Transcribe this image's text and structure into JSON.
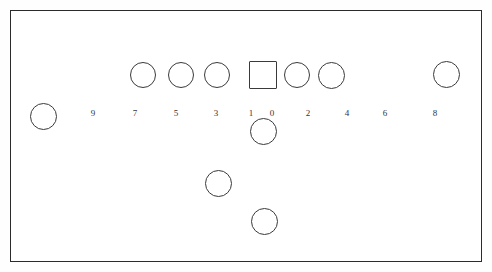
{
  "diagram": {
    "title": "",
    "canvas": {
      "width": 492,
      "height": 272,
      "background": "#fefefe"
    },
    "frame": {
      "x": 10,
      "y": 10,
      "width": 472,
      "height": 252,
      "stroke": "#2b2b2b",
      "stroke_width": 1.5
    },
    "stroke_color": "#3a3a3a",
    "label_color": "#34343a",
    "labels": [
      {
        "text": "9",
        "x": 93,
        "y": 108
      },
      {
        "text": "7",
        "x": 135,
        "y": 108
      },
      {
        "text": "5",
        "x": 176,
        "y": 108
      },
      {
        "text": "3",
        "x": 216,
        "y": 108
      },
      {
        "text": "1",
        "x": 251,
        "y": 108
      },
      {
        "text": "0",
        "x": 272,
        "y": 108
      },
      {
        "text": "2",
        "x": 308,
        "y": 108
      },
      {
        "text": "4",
        "x": 347,
        "y": 108
      },
      {
        "text": "6",
        "x": 385,
        "y": 108
      },
      {
        "text": "8",
        "x": 435,
        "y": 108
      }
    ],
    "shapes": [
      {
        "kind": "circle",
        "name": "circle-far-left",
        "cx": 43,
        "cy": 116,
        "d": 27
      },
      {
        "kind": "circle",
        "name": "circle-row-9",
        "cx": 143,
        "cy": 75,
        "d": 26
      },
      {
        "kind": "circle",
        "name": "circle-row-7",
        "cx": 181,
        "cy": 75,
        "d": 26
      },
      {
        "kind": "circle",
        "name": "circle-row-5",
        "cx": 217,
        "cy": 75,
        "d": 26
      },
      {
        "kind": "square",
        "name": "square-row-center",
        "cx": 263,
        "cy": 75,
        "d": 28
      },
      {
        "kind": "circle",
        "name": "circle-row-2",
        "cx": 297,
        "cy": 75,
        "d": 26
      },
      {
        "kind": "circle",
        "name": "circle-row-4",
        "cx": 331,
        "cy": 75,
        "d": 27
      },
      {
        "kind": "circle",
        "name": "circle-row-8",
        "cx": 446,
        "cy": 74,
        "d": 27
      },
      {
        "kind": "circle",
        "name": "circle-below-center",
        "cx": 263,
        "cy": 131,
        "d": 27
      },
      {
        "kind": "circle",
        "name": "circle-lower-left",
        "cx": 218,
        "cy": 183,
        "d": 27
      },
      {
        "kind": "circle",
        "name": "circle-bottom-center",
        "cx": 264,
        "cy": 221,
        "d": 27
      }
    ]
  }
}
